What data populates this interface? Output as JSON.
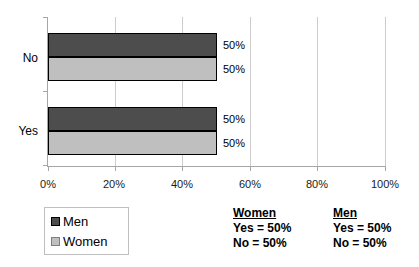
{
  "chart_data": {
    "type": "bar",
    "orientation": "horizontal",
    "title": "",
    "xlabel": "",
    "ylabel": "",
    "categories": [
      "No",
      "Yes"
    ],
    "series": [
      {
        "name": "Men",
        "color": "#4d4d4d",
        "values": [
          50,
          50
        ],
        "data_labels": [
          "50%",
          "50%"
        ]
      },
      {
        "name": "Women",
        "color": "#bfbfbf",
        "values": [
          50,
          50
        ],
        "data_labels": [
          "50%",
          "50%"
        ]
      }
    ],
    "xlim": [
      0,
      100
    ],
    "xticks": [
      "0%",
      "20%",
      "40%",
      "60%",
      "80%",
      "100%"
    ],
    "xtick_values": [
      0,
      20,
      40,
      60,
      80,
      100
    ],
    "grid": "vertical-gridlines-on",
    "legend_position": "bottom-left"
  },
  "legend": {
    "items": [
      {
        "label": "Men",
        "color": "#4d4d4d"
      },
      {
        "label": "Women",
        "color": "#bfbfbf"
      }
    ]
  },
  "annotations": [
    {
      "heading": "Women",
      "lines": [
        "Yes = 50%",
        "No = 50%"
      ]
    },
    {
      "heading": "Men",
      "lines": [
        "Yes = 50%",
        "No = 50%"
      ]
    }
  ],
  "colors": {
    "men_bar": "#4d4d4d",
    "women_bar": "#bfbfbf",
    "bar_border": "#000000",
    "gridline": "#cdcdcd",
    "axis": "#a6a6a6"
  }
}
